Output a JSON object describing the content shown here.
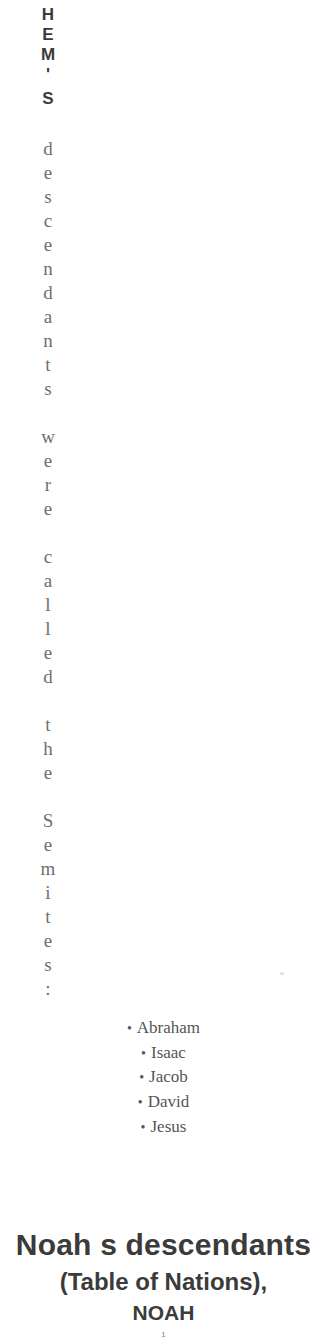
{
  "vertical_text": {
    "bold_chars": [
      "H",
      "E",
      "M",
      "'",
      "S"
    ],
    "serif_chars": [
      "d",
      "e",
      "s",
      "c",
      "e",
      "n",
      "d",
      "a",
      "n",
      "t",
      "s",
      " ",
      "w",
      "e",
      "r",
      "e",
      " ",
      "c",
      "a",
      "l",
      "l",
      "e",
      "d",
      " ",
      "t",
      "h",
      "e",
      " ",
      "S",
      "e",
      "m",
      "i",
      "t",
      "e",
      "s",
      ":"
    ],
    "full_text": "HEM'S descendants were called the Semites:"
  },
  "list": {
    "bullet": "•",
    "items": [
      "Abraham",
      "Isaac",
      "Jacob",
      "David",
      "Jesus"
    ]
  },
  "heading": {
    "line1": "Noah s descendants",
    "line2": "(Table of Nations),",
    "line3": "NOAH"
  },
  "page_number": "1"
}
